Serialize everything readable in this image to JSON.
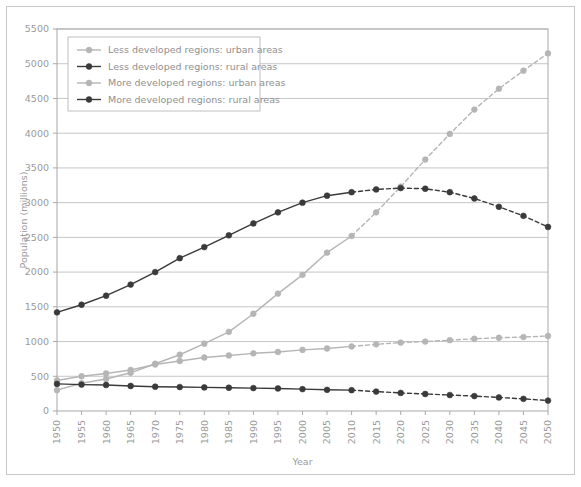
{
  "chart_data": {
    "type": "line",
    "title": "",
    "xlabel": "Year",
    "ylabel": "Population (millions)",
    "xlim": [
      1950,
      2050
    ],
    "ylim": [
      0,
      5500
    ],
    "ytick_step": 500,
    "xtick_step": 5,
    "grid": true,
    "legend_position": "top-left",
    "projection_starts": 2010,
    "x": [
      1950,
      1955,
      1960,
      1965,
      1970,
      1975,
      1980,
      1985,
      1990,
      1995,
      2000,
      2005,
      2010,
      2015,
      2020,
      2025,
      2030,
      2035,
      2040,
      2045,
      2050
    ],
    "xticklabels": [
      "1950",
      "1955",
      "1960",
      "1965",
      "1970",
      "1975",
      "1980",
      "1985",
      "1990",
      "1995",
      "2000",
      "2005",
      "2010",
      "2015",
      "2020",
      "2025",
      "2030",
      "2035",
      "2040",
      "2045",
      "2050"
    ],
    "yticklabels": [
      "0",
      "500",
      "1000",
      "1500",
      "2000",
      "2500",
      "3000",
      "3500",
      "4000",
      "4500",
      "5000",
      "5500"
    ],
    "yticks": [
      0,
      500,
      1000,
      1500,
      2000,
      2500,
      3000,
      3500,
      4000,
      4500,
      5000,
      5500
    ],
    "series": [
      {
        "name": "Less developed regions: urban areas",
        "color": "#b5b5b5",
        "marker": "circle",
        "values": [
          300,
          400,
          460,
          550,
          680,
          810,
          970,
          1140,
          1400,
          1690,
          1960,
          2280,
          2520,
          2860,
          3230,
          3620,
          3990,
          4340,
          4640,
          4900,
          5150
        ]
      },
      {
        "name": "Less developed regions: rural areas",
        "color": "#3a3a3a",
        "marker": "circle",
        "values": [
          1420,
          1530,
          1660,
          1820,
          2000,
          2200,
          2360,
          2530,
          2700,
          2860,
          3000,
          3100,
          3150,
          3190,
          3210,
          3200,
          3150,
          3060,
          2940,
          2810,
          2650
        ]
      },
      {
        "name": "More developed regions: urban areas",
        "color": "#b5b5b5",
        "marker": "circle",
        "values": [
          440,
          500,
          540,
          590,
          670,
          720,
          770,
          800,
          830,
          850,
          880,
          900,
          930,
          960,
          985,
          1000,
          1020,
          1040,
          1055,
          1065,
          1080
        ]
      },
      {
        "name": "More developed regions: rural areas",
        "color": "#3a3a3a",
        "marker": "circle",
        "values": [
          390,
          380,
          375,
          360,
          350,
          345,
          340,
          335,
          330,
          325,
          315,
          305,
          300,
          280,
          260,
          245,
          230,
          215,
          195,
          175,
          150
        ]
      }
    ]
  }
}
